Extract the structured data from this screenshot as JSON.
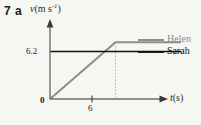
{
  "question": {
    "number": "7 a"
  },
  "axes": {
    "y_label_symbol": "v",
    "y_label_unit_pre": "(m s",
    "y_label_unit_exp": "-1",
    "y_label_unit_post": ")",
    "x_label_symbol": "t",
    "x_label_unit": "(s)",
    "origin_label": "0",
    "y_tick_label": "6.2",
    "x_tick_label": "6"
  },
  "legend": {
    "helen": "Helen",
    "sarah": "Sarah",
    "helen_color": "#8d8d8d",
    "sarah_color": "#111111"
  },
  "chart_data": {
    "type": "line",
    "title": "",
    "xlabel": "t (s)",
    "ylabel": "v (m s^-1)",
    "xlim": [
      0,
      12
    ],
    "ylim": [
      0,
      9
    ],
    "xticks": [
      0,
      6
    ],
    "xticklabels": [
      "0",
      "6"
    ],
    "yticks": [
      6.2
    ],
    "yticklabels": [
      "6.2"
    ],
    "grid": false,
    "legend_position": "right",
    "annotations": [
      {
        "type": "dotted-vertical",
        "x": 6,
        "from_y": 0,
        "to_y": 7.4,
        "color": "#b4b4b4"
      }
    ],
    "series": [
      {
        "name": "Helen",
        "color": "#8d8d8d",
        "x": [
          0,
          6,
          12
        ],
        "y": [
          0,
          7.4,
          7.4
        ]
      },
      {
        "name": "Sarah",
        "color": "#111111",
        "x": [
          0,
          12
        ],
        "y": [
          6.2,
          6.2
        ]
      }
    ]
  }
}
